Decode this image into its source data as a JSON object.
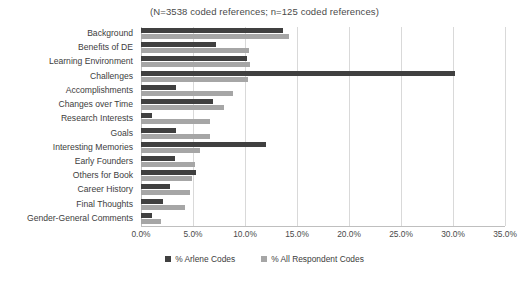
{
  "chart_data": {
    "type": "bar",
    "orientation": "horizontal",
    "title": "(N=3538 coded references; n=125 coded references)",
    "xlabel": "",
    "ylabel": "",
    "xlim": [
      0,
      35
    ],
    "xticks": [
      "0.0%",
      "5.0%",
      "10.0%",
      "15.0%",
      "20.0%",
      "25.0%",
      "30.0%",
      "35.0%"
    ],
    "xtick_values": [
      0,
      5,
      10,
      15,
      20,
      25,
      30,
      35
    ],
    "grid": true,
    "legend_position": "bottom",
    "categories": [
      "Background",
      "Benefits of DE",
      "Learning Environment",
      "Challenges",
      "Accomplishments",
      "Changes over Time",
      "Research Interests",
      "Goals",
      "Interesting Memories",
      "Early Founders",
      "Others for Book",
      "Career History",
      "Final Thoughts",
      "Gender-General Comments"
    ],
    "series": [
      {
        "name": "% Arlene Codes",
        "color": "#404040",
        "values": [
          13.7,
          7.2,
          10.2,
          30.2,
          3.4,
          6.9,
          1.1,
          3.4,
          12.0,
          3.3,
          5.3,
          2.8,
          2.1,
          1.1
        ]
      },
      {
        "name": "% All Respondent Codes",
        "color": "#a6a6a6",
        "values": [
          14.2,
          10.4,
          10.5,
          10.3,
          8.8,
          8.0,
          6.6,
          6.6,
          5.7,
          5.2,
          4.9,
          4.7,
          4.2,
          1.9
        ]
      }
    ]
  }
}
